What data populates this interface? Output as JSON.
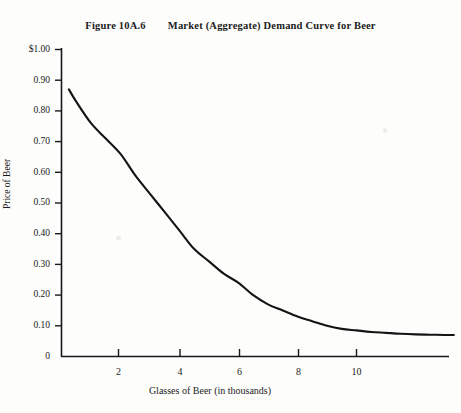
{
  "figure": {
    "number": "Figure 10A.6",
    "caption": "Market (Aggregate) Demand Curve for Beer"
  },
  "chart_data": {
    "type": "line",
    "title": "Market (Aggregate) Demand Curve for Beer",
    "xlabel": "Glasses of Beer (in thousands)",
    "ylabel": "Price of Beer",
    "xlim": [
      0,
      13.3
    ],
    "ylim": [
      0,
      1.0
    ],
    "grid": false,
    "legend": false,
    "xticks": [
      2,
      4,
      6,
      8,
      10
    ],
    "xtick_labels": [
      "2",
      "4",
      "6",
      "8",
      "10"
    ],
    "yticks": [
      0,
      0.1,
      0.2,
      0.3,
      0.4,
      0.5,
      0.6,
      0.7,
      0.8,
      0.9,
      1.0
    ],
    "ytick_labels": [
      "0",
      "0.10",
      "0.20",
      "0.30",
      "0.40",
      "0.50",
      "0.60",
      "0.70",
      "0.80",
      "0.90",
      "$1.00"
    ],
    "series": [
      {
        "name": "Market demand for beer",
        "x": [
          0.25,
          0.5,
          1.0,
          1.5,
          2.0,
          2.5,
          3.0,
          3.5,
          4.0,
          4.5,
          5.0,
          5.5,
          6.0,
          6.5,
          7.0,
          7.5,
          8.0,
          8.5,
          9.0,
          9.5,
          10.0,
          10.5,
          11.0,
          11.5,
          12.0,
          12.5,
          13.0,
          13.3
        ],
        "y": [
          0.87,
          0.83,
          0.76,
          0.71,
          0.66,
          0.59,
          0.53,
          0.47,
          0.41,
          0.35,
          0.31,
          0.27,
          0.24,
          0.2,
          0.17,
          0.15,
          0.13,
          0.115,
          0.1,
          0.09,
          0.085,
          0.08,
          0.077,
          0.074,
          0.072,
          0.071,
          0.07,
          0.07
        ]
      }
    ]
  }
}
